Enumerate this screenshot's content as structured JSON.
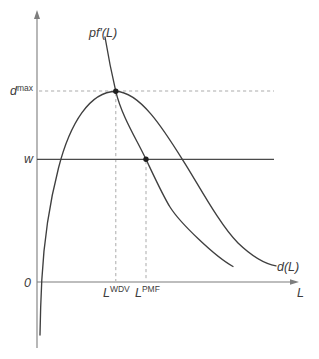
{
  "figure": {
    "background": "#ffffff",
    "colors": {
      "curve": "#3f3f3f",
      "axis": "#7d7d7d",
      "dashed_guide": "#ababab",
      "wage_line": "#4a4a4a",
      "dot": "#1f1f1f",
      "text": "#3c3c3c"
    },
    "axes": {
      "origin_label": "0",
      "x_label": "L"
    },
    "curves": {
      "marginal_value_product_label": "pf′(L)",
      "dividend_label": "d(L)"
    },
    "guides": {
      "dividend_max_base": "d",
      "dividend_max_sup": "max",
      "wage_label": "w"
    },
    "x_points": {
      "wdv_base": "L",
      "wdv_sup": "WDV",
      "pmf_base": "L",
      "pmf_sup": "PMF"
    }
  }
}
